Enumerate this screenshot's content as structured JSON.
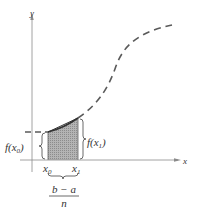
{
  "diagram": {
    "axes": {
      "x_label": "x",
      "y_label": "y"
    },
    "labels": {
      "f_x0": "f(x",
      "f_x0_sub": "0",
      "f_x0_close": ")",
      "f_x1": "f(x",
      "f_x1_sub": "1",
      "f_x1_close": ")",
      "x0": "x",
      "x0_sub": "0",
      "x1": "x",
      "x1_sub": "1",
      "width_numerator": "b − a",
      "width_denominator": "n"
    },
    "colors": {
      "axis": "#8a8a8a",
      "curve": "#5a5a5a",
      "shade": "#a9a9a9",
      "text": "#333333"
    }
  }
}
